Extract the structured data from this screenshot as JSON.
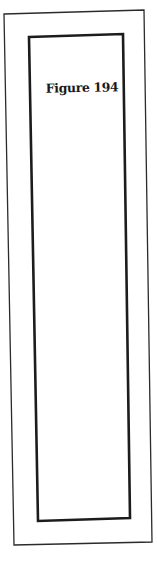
{
  "figure": {
    "caption": "Figure 194"
  },
  "frames": {
    "outer": {
      "points": "4,14 144,10 152,542 14,545",
      "stroke": "#2b2b2b",
      "stroke_width": 1.3
    },
    "inner": {
      "points": "29,37 123,34 130,518 38,521",
      "stroke": "#1c1c1c",
      "stroke_width": 2.6
    }
  },
  "colors": {
    "background": "#ffffff",
    "ink": "#1a1a1a"
  }
}
